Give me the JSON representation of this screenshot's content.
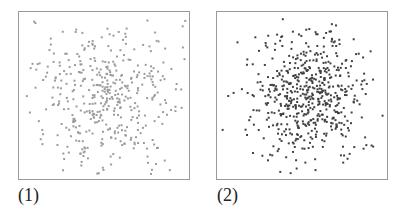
{
  "chart_data": [
    {
      "type": "scatter",
      "title": "",
      "panel_label": "(1)",
      "xlabel": "",
      "ylabel": "",
      "grid": false,
      "axes_ticks": false,
      "point_color": "#9a9a9a",
      "point_size": 2,
      "approx_point_count": 420,
      "distribution": {
        "kind": "2d-gaussian-cloud",
        "center": [
          0.5,
          0.5
        ],
        "spread": [
          0.22,
          0.23
        ],
        "density": "diffuse"
      },
      "seed": 17
    },
    {
      "type": "scatter",
      "title": "",
      "panel_label": "(2)",
      "xlabel": "",
      "ylabel": "",
      "grid": false,
      "axes_ticks": false,
      "point_color": "#3f3f3f",
      "point_size": 2,
      "approx_point_count": 560,
      "distribution": {
        "kind": "2d-gaussian-cloud",
        "center": [
          0.53,
          0.48
        ],
        "spread": [
          0.17,
          0.19
        ],
        "density": "concentrated"
      },
      "seed": 91
    }
  ],
  "labels": {
    "panel1": "(1)",
    "panel2": "(2)"
  },
  "colors": {
    "frame": "#9a9a9a",
    "background": "#ffffff"
  }
}
